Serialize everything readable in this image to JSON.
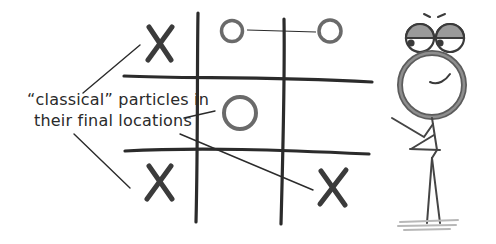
{
  "diagram": {
    "type": "hand-drawn illustration",
    "annotation": {
      "line1": "“classical” particles in",
      "line2": "their final locations"
    },
    "grid": {
      "rows": 3,
      "cols": 3,
      "cells": [
        [
          "X",
          "O",
          "O"
        ],
        [
          "",
          "O",
          ""
        ],
        [
          "X",
          "",
          "X"
        ]
      ]
    },
    "colors": {
      "ink": "#2b2b2b",
      "marker": "#555555",
      "shade": "#8a8a8a",
      "background": "#ffffff"
    },
    "figure": "stick figure with magnifying-glass head and goggles"
  }
}
